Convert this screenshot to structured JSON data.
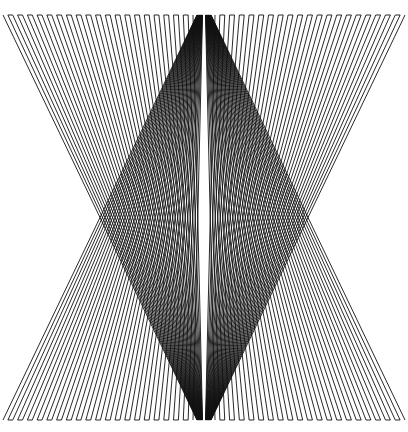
{
  "figure": {
    "width": 408,
    "height": 432,
    "background": "#ffffff",
    "stroke_color": "#111111",
    "stroke_width": 0.9,
    "top_y": 15,
    "bottom_y": 420,
    "top_apex": [
      204,
      14
    ],
    "bottom_apex": [
      204,
      421
    ],
    "left_fan": {
      "edge_x_range": [
        3,
        193
      ],
      "center_x_range": [
        197,
        202.5
      ],
      "pairs": 20
    },
    "right_fan": {
      "edge_x_range": [
        405,
        215
      ],
      "center_x_range": [
        211,
        205.5
      ],
      "pairs": 20
    }
  },
  "caption_fragment": "· · ·  · ·"
}
